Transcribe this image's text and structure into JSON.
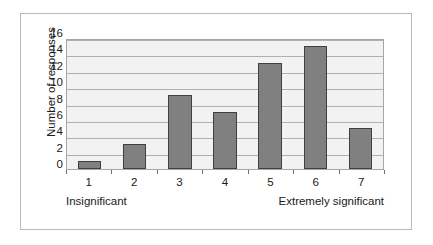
{
  "chart_data": {
    "type": "bar",
    "title": "",
    "subtitle": "",
    "xlabel": "",
    "ylabel": "Number of responses",
    "categories": [
      "1",
      "2",
      "3",
      "4",
      "5",
      "6",
      "7"
    ],
    "values": [
      1,
      3,
      9,
      7,
      13,
      15,
      5
    ],
    "series": [
      {
        "name": "Number of responses",
        "values": [
          1,
          3,
          9,
          7,
          13,
          15,
          5
        ]
      }
    ],
    "ylim": [
      0,
      16
    ],
    "ytick_step": 2,
    "yticks": [
      "16",
      "14",
      "12",
      "10",
      "8",
      "6",
      "4",
      "2",
      "0"
    ],
    "xlim_labels": [
      "1",
      "7"
    ],
    "grid": true,
    "grid_axis": "y",
    "legend": false,
    "legend_position": "none",
    "annotations": {
      "left_anchor": "Insignificant",
      "right_anchor": "Extremely significant"
    },
    "colors": {
      "bar_fill": "#808080",
      "bar_border": "#404040",
      "plot_background": "#f2f2f2",
      "gridline": "#b0b0b0",
      "axis": "#a6a6a6",
      "frame_border": "#b9b9b9",
      "text": "#1a1a1a"
    }
  }
}
